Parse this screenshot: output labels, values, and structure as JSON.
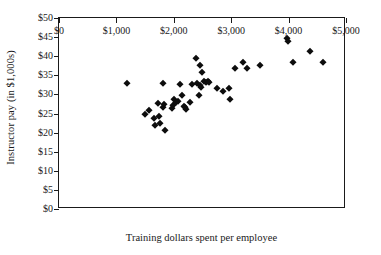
{
  "chart_data": {
    "type": "scatter",
    "title": "",
    "xlabel": "Training dollars spent per employee",
    "ylabel": "Instructor pay (in $1,000s)",
    "xlim": [
      0,
      5000
    ],
    "ylim": [
      0,
      50
    ],
    "grid": false,
    "legend": null,
    "marker": "diamond",
    "marker_color": "#0d0d0d",
    "xticks": [
      0,
      1000,
      2000,
      3000,
      4000,
      5000
    ],
    "xticklabels": [
      "$0",
      "$1,000",
      "$2,000",
      "$3,000",
      "$4,000",
      "$5,000"
    ],
    "yticks": [
      0,
      5,
      10,
      15,
      20,
      25,
      30,
      35,
      40,
      45,
      50
    ],
    "yticklabels": [
      "$0",
      "$5",
      "$10",
      "$15",
      "$20",
      "$25",
      "$30",
      "$35",
      "$40",
      "$45",
      "$50"
    ],
    "points": [
      {
        "x": 1180,
        "y": 32.9
      },
      {
        "x": 1500,
        "y": 25.0
      },
      {
        "x": 1570,
        "y": 25.8
      },
      {
        "x": 1660,
        "y": 23.8
      },
      {
        "x": 1680,
        "y": 22.1
      },
      {
        "x": 1730,
        "y": 27.8
      },
      {
        "x": 1740,
        "y": 24.3
      },
      {
        "x": 1760,
        "y": 22.6
      },
      {
        "x": 1810,
        "y": 32.9
      },
      {
        "x": 1820,
        "y": 26.6
      },
      {
        "x": 1830,
        "y": 27.6
      },
      {
        "x": 1840,
        "y": 20.8
      },
      {
        "x": 1960,
        "y": 26.5
      },
      {
        "x": 1980,
        "y": 27.2
      },
      {
        "x": 2000,
        "y": 28.9
      },
      {
        "x": 2040,
        "y": 27.9
      },
      {
        "x": 2080,
        "y": 28.4
      },
      {
        "x": 2100,
        "y": 32.8
      },
      {
        "x": 2150,
        "y": 29.9
      },
      {
        "x": 2180,
        "y": 26.9
      },
      {
        "x": 2200,
        "y": 26.7
      },
      {
        "x": 2210,
        "y": 26.1
      },
      {
        "x": 2290,
        "y": 27.9
      },
      {
        "x": 2310,
        "y": 32.8
      },
      {
        "x": 2380,
        "y": 39.6
      },
      {
        "x": 2400,
        "y": 33.0
      },
      {
        "x": 2440,
        "y": 29.9
      },
      {
        "x": 2450,
        "y": 32.4
      },
      {
        "x": 2460,
        "y": 37.6
      },
      {
        "x": 2470,
        "y": 31.9
      },
      {
        "x": 2490,
        "y": 35.8
      },
      {
        "x": 2520,
        "y": 33.4
      },
      {
        "x": 2560,
        "y": 33.3
      },
      {
        "x": 2600,
        "y": 33.6
      },
      {
        "x": 2620,
        "y": 33.2
      },
      {
        "x": 2760,
        "y": 31.8
      },
      {
        "x": 2850,
        "y": 30.8
      },
      {
        "x": 2960,
        "y": 31.8
      },
      {
        "x": 2980,
        "y": 28.8
      },
      {
        "x": 3070,
        "y": 36.8
      },
      {
        "x": 3200,
        "y": 38.4
      },
      {
        "x": 3280,
        "y": 36.8
      },
      {
        "x": 3500,
        "y": 37.6
      },
      {
        "x": 3980,
        "y": 44.8
      },
      {
        "x": 3990,
        "y": 43.9
      },
      {
        "x": 4070,
        "y": 38.4
      },
      {
        "x": 4380,
        "y": 41.4
      },
      {
        "x": 4600,
        "y": 38.4
      }
    ]
  }
}
